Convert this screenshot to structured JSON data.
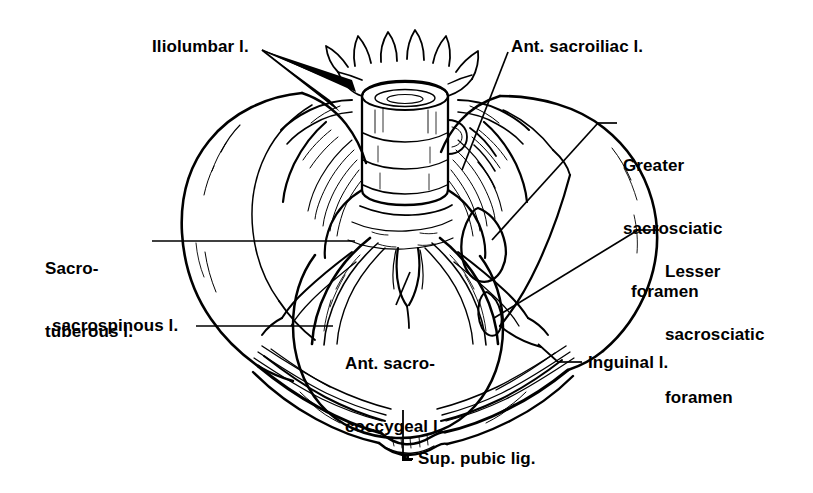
{
  "figure": {
    "view": "anterior",
    "ink_color": "#000000",
    "background_color": "#ffffff",
    "width": 813,
    "height": 493
  },
  "labels": [
    {
      "id": "iliolumbar",
      "name": "iliolumbar-ligament-label",
      "text": "Iliolumbar l.",
      "lines": [
        "Iliolumbar l."
      ],
      "x": 152,
      "y": 36,
      "leader": "two-arrowheads-right",
      "align": "left"
    },
    {
      "id": "ant-sacroiliac",
      "name": "anterior-sacroiliac-ligament-label",
      "text": "Ant. sacroiliac l.",
      "lines": [
        "Ant. sacroiliac l."
      ],
      "x": 511,
      "y": 36,
      "leader": "diagonal-down-left",
      "align": "left"
    },
    {
      "id": "greater-sacrosciatic-foramen",
      "name": "greater-sacrosciatic-foramen-label",
      "text": "Greater sacrosciatic foramen",
      "lines": [
        "Greater",
        "sacrosciatic",
        "foramen"
      ],
      "x": 623,
      "y": 113,
      "leader": "elbow-left",
      "align": "left"
    },
    {
      "id": "lesser-sacrosciatic-foramen",
      "name": "lesser-sacrosciatic-foramen-label",
      "text": "Lesser sacrosciatic foramen",
      "lines": [
        "Lesser",
        "sacrosciatic",
        "foramen"
      ],
      "x": 665,
      "y": 219,
      "leader": "elbow-left",
      "align": "left"
    },
    {
      "id": "sacrotuberous",
      "name": "sacrotuberous-ligament-label",
      "text": "Sacro- tuberous l.",
      "lines": [
        "Sacro-",
        "tuberous l."
      ],
      "x": 45,
      "y": 216,
      "leader": "horizontal-right",
      "align": "left"
    },
    {
      "id": "sacrospinous",
      "name": "sacrospinous-ligament-label",
      "text": "sacrospinous l.",
      "lines": [
        "sacrospinous l."
      ],
      "x": 52,
      "y": 315,
      "leader": "horizontal-right",
      "align": "left"
    },
    {
      "id": "ant-sacrococcygeal",
      "name": "anterior-sacrococcygeal-ligament-label",
      "text": "Ant. sacro- coccygeal l.",
      "lines": [
        "Ant. sacro-",
        "coccygeal l."
      ],
      "x": 345,
      "y": 311,
      "leader": "up-to-coccyx",
      "align": "left"
    },
    {
      "id": "inguinal",
      "name": "inguinal-ligament-label",
      "text": "Inguinal l.",
      "lines": [
        "Inguinal l."
      ],
      "x": 588,
      "y": 352,
      "leader": "elbow-left",
      "align": "left"
    },
    {
      "id": "sup-pubic-lig",
      "name": "superior-pubic-ligament-label",
      "text": "Sup. pubic lig.",
      "lines": [
        "Sup. pubic lig."
      ],
      "x": 418,
      "y": 448,
      "leader": "elbow-up",
      "align": "left"
    }
  ],
  "anatomy_parts": [
    {
      "name": "lumbar-vertebra",
      "description": "L5 vertebral body with transverse and spinous processes at top center"
    },
    {
      "name": "left-ilium",
      "description": "Left iliac wing, large fan-shaped bone on left side"
    },
    {
      "name": "right-ilium",
      "description": "Right iliac wing, large fan-shaped bone on right side"
    },
    {
      "name": "sacrum",
      "description": "Sacrum, triangular bone in midline below vertebra"
    },
    {
      "name": "coccyx",
      "description": "Coccyx, small tapering bone at inferior sacrum"
    },
    {
      "name": "pelvic-inlet",
      "description": "Pelvic brim / obturator ring opening in center"
    },
    {
      "name": "pubic-symphysis",
      "description": "Pubic symphysis at inferior midline"
    },
    {
      "name": "left-pubic-ramus",
      "description": "Left superior pubic ramus"
    },
    {
      "name": "right-pubic-ramus",
      "description": "Right superior pubic ramus"
    },
    {
      "name": "left-ischial-spine",
      "description": "Left ischial spine"
    },
    {
      "name": "right-ischial-spine",
      "description": "Right ischial spine"
    }
  ]
}
